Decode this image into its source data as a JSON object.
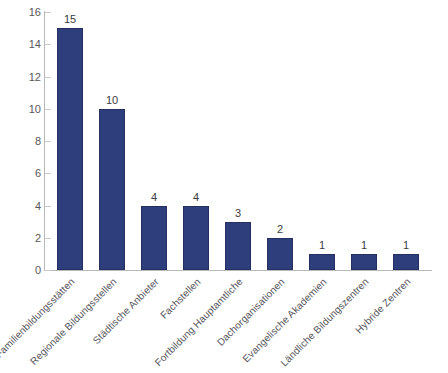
{
  "chart_data": {
    "type": "bar",
    "title": "",
    "subtitle": "",
    "xlabel": "",
    "ylabel": "",
    "ylim": [
      0,
      16
    ],
    "ytick_step": 2,
    "yticks": [
      0,
      2,
      4,
      6,
      8,
      10,
      12,
      14,
      16
    ],
    "grid": false,
    "legend": false,
    "bar_color": "#2E3D7C",
    "categories": [
      "Familienbildungsstätten",
      "Regionale Bildungsstellen",
      "Städtische Anbieter",
      "Fachstellen",
      "Fortbildung Hauptamtliche",
      "Dachorganisationen",
      "Evangelische Akademien",
      "Ländliche Bildungszentren",
      "Hybride Zentren"
    ],
    "values": [
      15,
      10,
      4,
      4,
      3,
      2,
      1,
      1,
      1
    ],
    "data_labels": [
      "15",
      "10",
      "4",
      "4",
      "3",
      "2",
      "1",
      "1",
      "1"
    ]
  }
}
